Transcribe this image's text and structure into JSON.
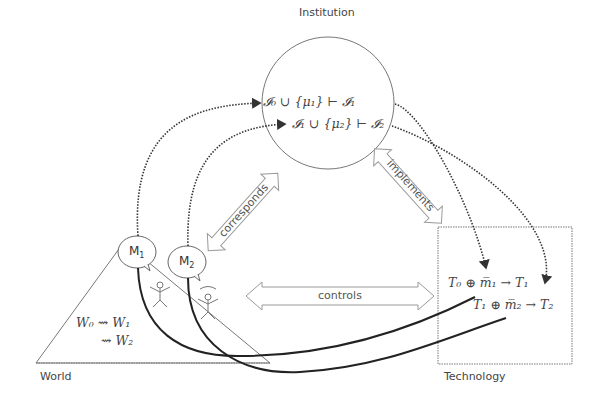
{
  "diagram": {
    "nodes": {
      "institution": {
        "label": "Institution"
      },
      "world": {
        "label": "World"
      },
      "technology": {
        "label": "Technology"
      }
    },
    "institution_formulas": [
      "𝓘₀ ∪ {μ₁} ⊢ 𝓘₁",
      "𝓘₁ ∪ {μ₂} ⊢ 𝓘₂"
    ],
    "world_formulas": [
      "W₀ ⇝ W₁",
      "⇝ W₂"
    ],
    "technology_formulas": [
      "T₀ ⊕ m̅₁ → T₁",
      "T₁ ⊕ m̅₂ → T₂"
    ],
    "bubbles": [
      {
        "label": "M",
        "sub": "1"
      },
      {
        "label": "M",
        "sub": "2"
      }
    ],
    "relations": {
      "corresponds": "corresponds",
      "implements": "implements",
      "controls": "controls"
    },
    "colors": {
      "line": "#555555",
      "curve": "#222222",
      "arrow_outline": "#9a9a9a"
    }
  }
}
